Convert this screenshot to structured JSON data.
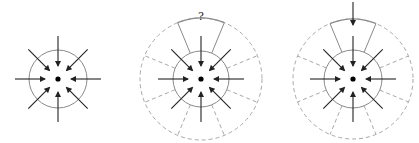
{
  "diagram": {
    "colors": {
      "arrow": "#222222",
      "inner_circle": "#8a8a8a",
      "outer_dashed": "#a8a8a8",
      "wedge": "#8a8a8a",
      "center_dot": "#000000"
    },
    "panels": [
      {
        "id": "panel-1",
        "center": [
          58,
          79
        ],
        "inner_radius": 29,
        "outer_radius": null,
        "inward_arrows": 8,
        "wedge_label": null,
        "top_outer_arrow": false
      },
      {
        "id": "panel-2",
        "center": [
          201,
          79
        ],
        "inner_radius": 28,
        "outer_radius": 61,
        "inward_arrows": 8,
        "wedge_label": "?",
        "top_outer_arrow": false
      },
      {
        "id": "panel-3",
        "center": [
          353,
          79
        ],
        "inner_radius": 29,
        "outer_radius": 60,
        "inward_arrows": 8,
        "wedge_label": null,
        "top_outer_arrow": true
      }
    ]
  }
}
